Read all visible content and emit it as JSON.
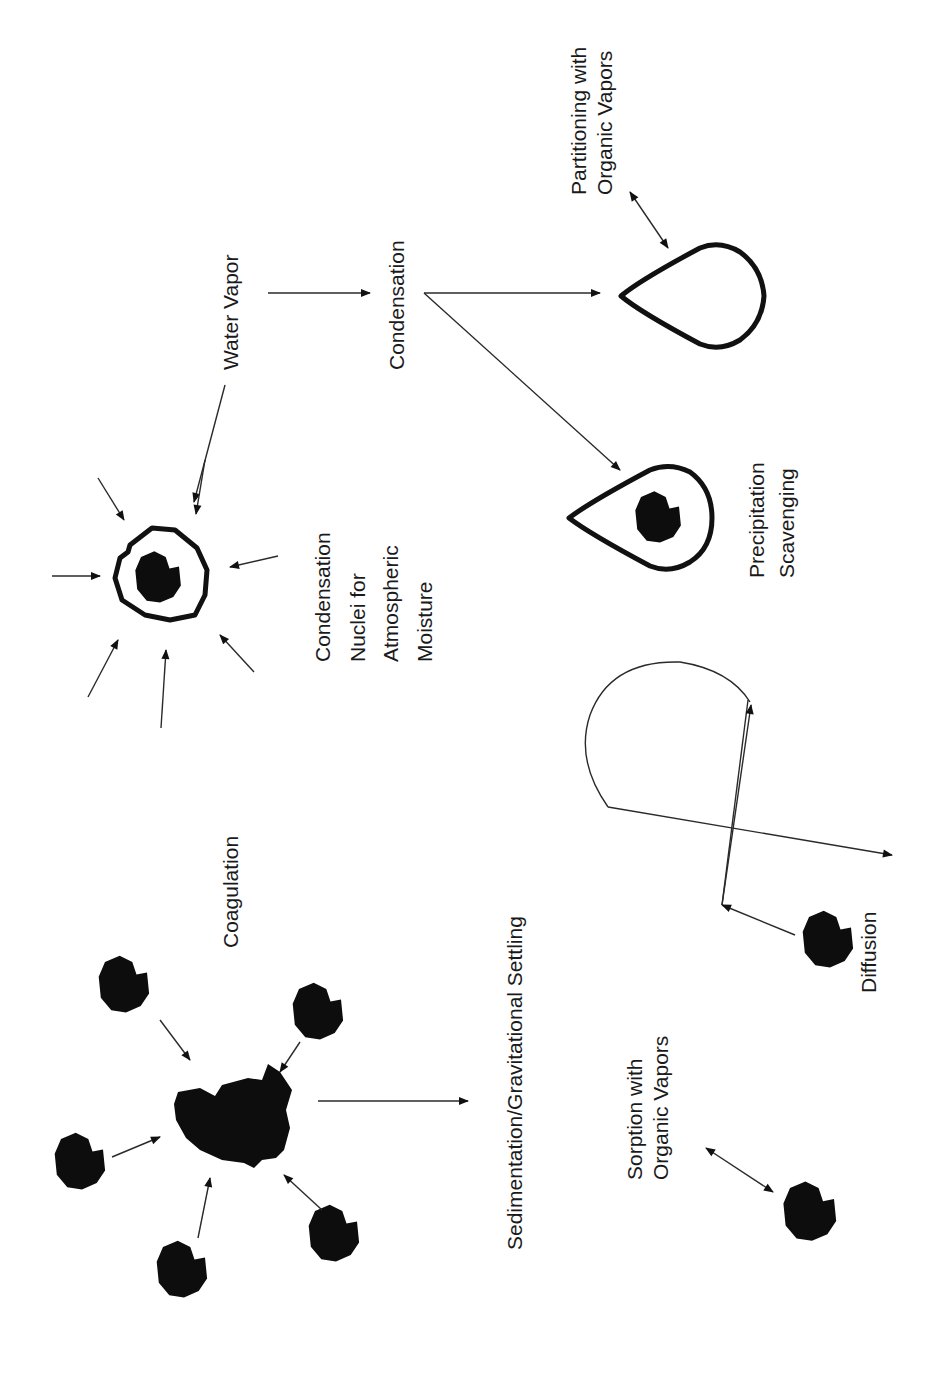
{
  "figure": {
    "orientation": "rotated 90 degrees counter-clockwise",
    "background_color": "#ffffff",
    "ink_color": "#111111"
  },
  "labels": {
    "water_vapor": "Water Vapor",
    "condensation": "Condensation",
    "partitioning_line1": "Partitioning with",
    "partitioning_line2": "Organic Vapors",
    "nuclei_line1": "Condensation",
    "nuclei_line2": "Nuclei for",
    "nuclei_line3": "Atmospheric",
    "nuclei_line4": "Moisture",
    "precip_line1": "Precipitation",
    "precip_line2": "Scavenging",
    "coagulation": "Coagulation",
    "sedimentation": "Sedimentation/Gravitational Settling",
    "diffusion": "Diffusion",
    "sorption_line1": "Sorption with",
    "sorption_line2": "Organic Vapors"
  },
  "processes": [
    {
      "name": "Condensation Nuclei for Atmospheric Moisture",
      "graphic": "particle with water shell, 8 incoming arrows"
    },
    {
      "name": "Condensation",
      "graphic": "arrows from water vapor to droplets"
    },
    {
      "name": "Partitioning with Organic Vapors",
      "graphic": "droplet with double-headed arrow"
    },
    {
      "name": "Precipitation Scavenging",
      "graphic": "droplet containing particle"
    },
    {
      "name": "Coagulation",
      "graphic": "6 particles converging to aggregate"
    },
    {
      "name": "Sedimentation/Gravitational Settling",
      "graphic": "arrow from aggregate"
    },
    {
      "name": "Diffusion",
      "graphic": "particle with random walk path"
    },
    {
      "name": "Sorption with Organic Vapors",
      "graphic": "particle with double-headed arrow"
    }
  ]
}
